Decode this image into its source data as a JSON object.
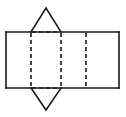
{
  "figure": {
    "background_color": "#ffffff",
    "stroke_color": "#1a1a1a",
    "stroke_width": 1.6,
    "canvas": {
      "width": 126,
      "height": 117
    },
    "rectangle": {
      "name": "base-rectangle",
      "x1": 6,
      "y1": 32,
      "x2": 119,
      "y2": 88,
      "width": 113,
      "height": 56,
      "line_style": "solid"
    },
    "fold_lines_vertical": [
      {
        "name": "fold-line-1",
        "x": 31,
        "y1": 32,
        "y2": 88,
        "line_style": "dashed"
      },
      {
        "name": "fold-line-2",
        "x": 61,
        "y1": 32,
        "y2": 88,
        "line_style": "dashed"
      },
      {
        "name": "fold-line-3",
        "x": 86,
        "y1": 32,
        "y2": 88,
        "line_style": "dashed"
      }
    ],
    "fold_lines_horizontal": [
      {
        "name": "fold-line-top",
        "y": 32,
        "x1": 31,
        "x2": 61,
        "line_style": "dashed"
      },
      {
        "name": "fold-line-bottom",
        "y": 88,
        "x1": 31,
        "x2": 61,
        "line_style": "dashed"
      }
    ],
    "triangle_top": {
      "name": "top-triangle",
      "orientation": "apex-up",
      "apex_x": 46,
      "apex_y": 8,
      "base_left_x": 31,
      "base_right_x": 61,
      "base_y": 32,
      "line_style": "solid"
    },
    "triangle_bottom": {
      "name": "bottom-triangle",
      "orientation": "apex-down",
      "apex_x": 46,
      "apex_y": 110,
      "base_left_x": 31,
      "base_right_x": 61,
      "base_y": 88,
      "line_style": "solid"
    }
  }
}
